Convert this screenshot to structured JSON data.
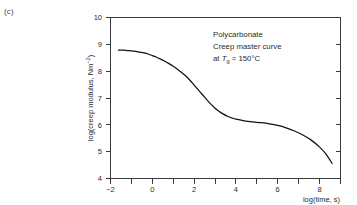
{
  "figure": {
    "panel_label": "(c)"
  },
  "annotation": {
    "line1": "Polycarbonate",
    "line2": "Creep master curve",
    "line3_prefix": "at ",
    "line3_symbol": "T",
    "line3_subscript": "g",
    "line3_suffix": " = 150°C"
  },
  "axes": {
    "x_title": "log(time, s)",
    "y_title_main": "log(creep modulus, Nm",
    "y_title_exponent": "−2",
    "y_title_close": ")",
    "x_tick_labels": [
      "−2",
      "0",
      "2",
      "4",
      "6",
      "8"
    ],
    "y_tick_labels": [
      "4",
      "5",
      "6",
      "7",
      "8",
      "9",
      "10"
    ]
  },
  "chart_data": {
    "type": "line",
    "xlabel": "log(time, s)",
    "ylabel": "log(creep modulus, Nm-2)",
    "xlim": [
      -2,
      9
    ],
    "ylim": [
      4,
      10
    ],
    "xticks": [
      -2,
      -1,
      0,
      1,
      2,
      3,
      4,
      5,
      6,
      7,
      8,
      9
    ],
    "xticklabels": [
      "-2",
      "",
      "0",
      "",
      "2",
      "",
      "4",
      "",
      "6",
      "",
      "8",
      ""
    ],
    "yticks": [
      4,
      5,
      6,
      7,
      8,
      9,
      10
    ],
    "yticklabels": [
      "4",
      "5",
      "6",
      "7",
      "8",
      "9",
      "10"
    ],
    "grid": false,
    "legend": null,
    "series": [
      {
        "name": "creep master curve",
        "x": [
          -1.62,
          -1.4,
          -1.2,
          -1.0,
          -0.8,
          -0.6,
          -0.4,
          -0.2,
          0.0,
          0.2,
          0.4,
          0.6,
          0.8,
          1.0,
          1.2,
          1.4,
          1.6,
          1.8,
          2.0,
          2.2,
          2.4,
          2.6,
          2.8,
          3.0,
          3.2,
          3.4,
          3.6,
          3.8,
          4.0,
          4.4,
          4.8,
          5.2,
          5.6,
          6.0,
          6.4,
          6.8,
          7.2,
          7.6,
          8.0,
          8.3,
          8.6
        ],
        "y": [
          8.78,
          8.78,
          8.77,
          8.76,
          8.74,
          8.71,
          8.68,
          8.64,
          8.58,
          8.52,
          8.45,
          8.37,
          8.28,
          8.18,
          8.07,
          7.95,
          7.82,
          7.66,
          7.48,
          7.3,
          7.12,
          6.94,
          6.77,
          6.62,
          6.5,
          6.4,
          6.32,
          6.26,
          6.21,
          6.15,
          6.11,
          6.08,
          6.04,
          5.98,
          5.89,
          5.77,
          5.62,
          5.43,
          5.17,
          4.92,
          4.56
        ]
      }
    ],
    "annotations": [
      {
        "text": "Polycarbonate",
        "x": 3.2,
        "y": 9.28
      },
      {
        "text": "Creep master curve",
        "x": 3.2,
        "y": 8.92
      },
      {
        "text": "at Tg = 150°C",
        "x": 3.2,
        "y": 8.56
      }
    ]
  }
}
